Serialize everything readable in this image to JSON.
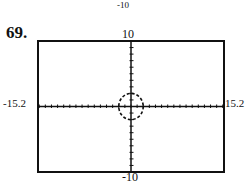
{
  "problem": {
    "number": "69."
  },
  "window": {
    "xmin_label": "-15.2",
    "xmax_label": "15.2",
    "ymax_label": "10",
    "ymin_label": "-10",
    "ymin_top_label": "-10"
  },
  "chart_data": {
    "type": "line",
    "title": "",
    "xlabel": "",
    "ylabel": "",
    "xlim": [
      -15.2,
      15.2
    ],
    "ylim": [
      -10,
      10
    ],
    "grid": false,
    "series": [
      {
        "name": "circle",
        "shape": "circle",
        "center": [
          0,
          0
        ],
        "radius": 2
      }
    ],
    "axes_ticks": {
      "x_step": 1,
      "y_step": 1
    }
  }
}
